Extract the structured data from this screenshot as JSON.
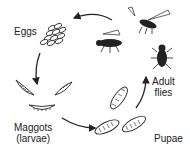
{
  "diagram": {
    "stages": [
      {
        "id": "eggs",
        "label": "Eggs"
      },
      {
        "id": "larvae",
        "label_line1": "Maggots",
        "label_line2": "(larvae)"
      },
      {
        "id": "pupae",
        "label": "Pupae"
      },
      {
        "id": "adult",
        "label_line1": "Adult",
        "label_line2": "flies"
      }
    ],
    "flow": [
      "Eggs",
      "Maggots (larvae)",
      "Pupae",
      "Adult flies",
      "Eggs"
    ],
    "colors": {
      "ink": "#222222",
      "background": "#ffffff"
    }
  }
}
